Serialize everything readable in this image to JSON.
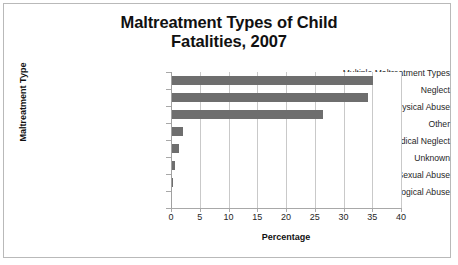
{
  "chart_data": {
    "type": "bar",
    "orientation": "horizontal",
    "title": "Maltreatment Types of Child Fatalities, 2007",
    "title_lines": [
      "Maltreatment Types of Child",
      "Fatalities, 2007"
    ],
    "xlabel": "Percentage",
    "ylabel": "Maltreatment Type",
    "categories": [
      "Multiple Maltreatment Types",
      "Neglect",
      "Physical Abuse",
      "Other",
      "Medical Neglect",
      "Unknown",
      "Sexual Abuse",
      "Psychological Abuse"
    ],
    "values": [
      35.0,
      34.0,
      26.3,
      1.9,
      1.2,
      0.6,
      0.2,
      0.0
    ],
    "xlim": [
      0,
      40
    ],
    "xticks": [
      0,
      5,
      10,
      15,
      20,
      25,
      30,
      35,
      40
    ],
    "xtick_labels": [
      "0",
      "5",
      "10",
      "15",
      "20",
      "25",
      "30",
      "35",
      "40"
    ],
    "grid": "vertical",
    "legend": "none",
    "bar_color": "#6e6e6e",
    "gridline_color": "#c9c9c9",
    "border_color": "#b9b9b9",
    "background_color": "#ffffff"
  }
}
